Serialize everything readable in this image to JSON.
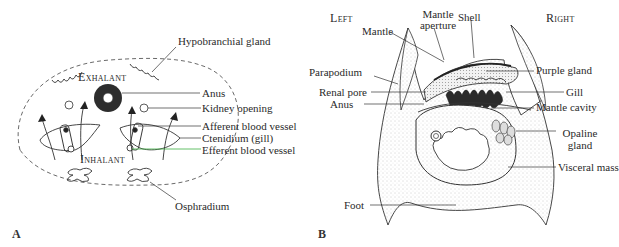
{
  "figure": {
    "panels": [
      {
        "id": "A",
        "panel_label": "A",
        "region_labels": {
          "top": "Exhalant",
          "bottom": "Inhalant"
        },
        "callouts": [
          "Hypobranchial gland",
          "Anus",
          "Kidney opening",
          "Afferent blood vessel",
          "Ctenidium (gill)",
          "Efferent blood vessel",
          "Osphradium"
        ]
      },
      {
        "id": "B",
        "panel_label": "B",
        "side_labels": {
          "left": "Left",
          "right": "Right"
        },
        "callouts": {
          "mantle": "Mantle",
          "mantle_aperture_1": "Mantle",
          "mantle_aperture_2": "aperture",
          "shell": "Shell",
          "parapodium": "Parapodium",
          "renal_pore": "Renal pore",
          "anus": "Anus",
          "purple_gland": "Purple gland",
          "gill": "Gill",
          "mantle_cavity": "Mantle cavity",
          "opaline_gland_1": "Opaline",
          "opaline_gland_2": "gland",
          "visceral_mass": "Visceral mass",
          "foot": "Foot"
        }
      }
    ]
  },
  "colors": {
    "line": "#333333",
    "stipple": "#bdbdbd",
    "highlight_leader": "#3cb043"
  }
}
